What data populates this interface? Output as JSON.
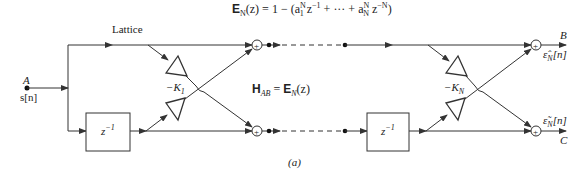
{
  "equation_top": {
    "lhs_E": "E",
    "lhs_sub": "N",
    "lhs_rest": "(z) = 1 − (a",
    "a1_sup": "N",
    "a1_sub": "1",
    "z1": " z",
    "z1_sup": "−1",
    "middle": " + ··· + a",
    "aN_sup": "N",
    "aN_sub": "N",
    "zN": " z",
    "zN_sup": "−N",
    "close": ")"
  },
  "labels": {
    "lattice": "Lattice",
    "input_node": "A",
    "input_signal": "s[n]",
    "output_top": "B",
    "output_bottom": "C",
    "eps_top": "ε̂",
    "eps_bottom": "ε̃",
    "eps_sub": "N",
    "eps_arg": "[n]",
    "gain1": "−K",
    "gain1_sub": "1",
    "gainN": "−K",
    "gainN_sub": "N",
    "delay": "z",
    "delay_sup": "−1",
    "transfer_H": "H",
    "transfer_H_sub": "AB",
    "transfer_eq": " = ",
    "transfer_E": "E",
    "transfer_E_sub": "N",
    "transfer_arg": "(z)",
    "caption": "(a)",
    "adder": "+"
  }
}
